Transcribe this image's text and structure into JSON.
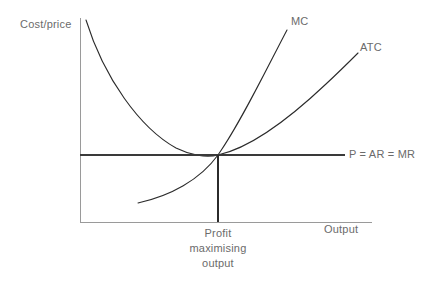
{
  "diagram": {
    "axes": {
      "y_label": "Cost/price",
      "x_label": "Output",
      "origin_x": 80,
      "origin_y": 222,
      "y_top": 18,
      "x_right": 372,
      "axis_color": "#9a9a9a"
    },
    "curves": [
      {
        "id": "mc",
        "label": "MC",
        "color": "#2b2b2b",
        "path": "M 138 203 C 170 196 200 180 218 155 C 240 124 266 70 287 30"
      },
      {
        "id": "atc",
        "label": "ATC",
        "color": "#2b2b2b",
        "path": "M 86 20 C 104 78 140 128 176 148 C 190 155 206 158 218 155 C 250 148 290 118 326 84 C 340 71 350 61 358 53"
      },
      {
        "id": "price",
        "label": "P = AR = MR",
        "color": "#3a3a3a",
        "path": "M 80 155 L 345 155"
      },
      {
        "id": "quantity-dropline",
        "label": "Profit maximising output",
        "color": "#2b2b2b",
        "path": "M 218 155 L 218 222"
      }
    ],
    "labels": {
      "cost_price": "Cost/price",
      "mc": "MC",
      "atc": "ATC",
      "price_line": "P = AR = MR",
      "output": "Output",
      "profit_max_line1": "Profit",
      "profit_max_line2": "maximising",
      "profit_max_line3": "output"
    },
    "equilibrium": {
      "x": 218,
      "y": 155,
      "description": "MC crosses ATC at its minimum, tangent to P = AR = MR"
    }
  }
}
